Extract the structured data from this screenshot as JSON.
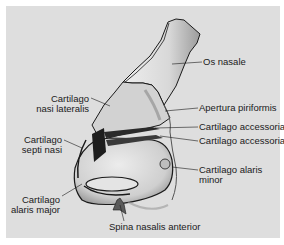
{
  "figure": {
    "labels": {
      "os_nasale": "Os nasale",
      "apertura_piriformis": "Apertura piriformis",
      "cartilago_accessoria_1": "Cartilago accessoria",
      "cartilago_accessoria_2": "Cartilago accessoria",
      "cartilago_alaris_minor_1": "Cartilago alaris",
      "cartilago_alaris_minor_2": "minor",
      "cartilago_nasi_lateralis_1": "Cartilago",
      "cartilago_nasi_lateralis_2": "nasi lateralis",
      "cartilago_septi_nasi_1": "Cartilago",
      "cartilago_septi_nasi_2": "septi nasi",
      "cartilago_alaris_major_1": "Cartilago",
      "cartilago_alaris_major_2": "alaris major",
      "spina_nasalis_anterior": "Spina nasalis anterior"
    },
    "colors": {
      "background": "#dedede",
      "line": "#1a1a1a",
      "bone_fill": "#e6e6e6",
      "shade": "#9a9a9a"
    }
  }
}
